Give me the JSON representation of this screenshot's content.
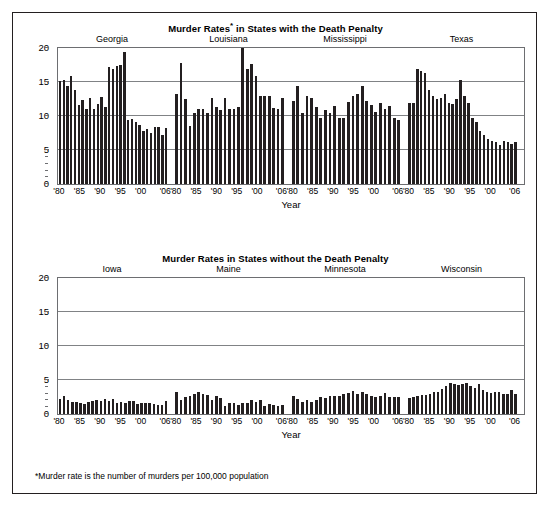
{
  "figure": {
    "footnote": "*Murder rate is the number of murders per 100,000 population",
    "frame_color": "#231f20",
    "bar_color": "#231f20",
    "grid_color": "#808285"
  },
  "chart_data": [
    {
      "type": "bar",
      "title": "Murder Rates* in States with the Death Penalty",
      "title_plain": "Murder Rates",
      "title_star": "*",
      "title_rest": " in States with the Death Penalty",
      "xlabel": "Year",
      "ylabel": "",
      "ylim": [
        0,
        20
      ],
      "yticks": [
        0,
        5,
        10,
        15,
        20
      ],
      "ytick_labels": [
        "0",
        "5",
        "10",
        "15",
        "20"
      ],
      "grid": true,
      "legend": "none",
      "x": [
        1980,
        1981,
        1982,
        1983,
        1984,
        1985,
        1986,
        1987,
        1988,
        1989,
        1990,
        1991,
        1992,
        1993,
        1994,
        1995,
        1996,
        1997,
        1998,
        1999,
        2000,
        2001,
        2002,
        2003,
        2004,
        2005,
        2006
      ],
      "xtick_years": [
        1980,
        1985,
        1990,
        1995,
        2000,
        2006
      ],
      "xtick_labels": [
        "'80",
        "'85",
        "'90",
        "'95",
        "'00",
        "'06"
      ],
      "series": [
        {
          "name": "Georgia",
          "values": [
            15.2,
            15.3,
            14.4,
            15.9,
            13.8,
            11.6,
            12.4,
            11.0,
            12.6,
            11.0,
            11.8,
            12.8,
            11.4,
            17.3,
            17.0,
            17.4,
            17.5,
            19.5,
            9.5,
            9.6,
            9.2,
            8.7,
            7.8,
            8.1,
            7.5,
            8.4,
            8.4,
            7.2,
            8.3
          ]
        },
        {
          "name": "Louisiana",
          "values": [
            13.3,
            17.8,
            12.5,
            8.6,
            10.4,
            11.0,
            11.1,
            10.5,
            12.7,
            11.3,
            10.9,
            12.6,
            11.1,
            11.0,
            11.4,
            20.0,
            16.9,
            17.7,
            15.9,
            13.0,
            13.0,
            12.9,
            11.2,
            11.1,
            12.7
          ]
        },
        {
          "name": "Mississippi",
          "values": [
            12.3,
            14.4,
            10.4,
            13.0,
            12.7,
            11.3,
            9.8,
            10.9,
            10.4,
            11.5,
            9.8,
            9.8,
            12.1,
            12.9,
            13.3,
            14.5,
            12.2,
            11.7,
            10.6,
            11.9,
            11.1,
            11.5,
            9.8,
            9.4
          ]
        },
        {
          "name": "Texas",
          "values": [
            12.0,
            11.9,
            16.9,
            16.7,
            16.3,
            13.8,
            12.9,
            12.5,
            12.7,
            13.3,
            12.0,
            11.8,
            12.5,
            15.3,
            13.0,
            11.9,
            9.8,
            9.1,
            7.8,
            7.2,
            6.6,
            6.3,
            6.2,
            5.8,
            6.4,
            6.2,
            5.9,
            6.2
          ]
        }
      ]
    },
    {
      "type": "bar",
      "title": "Murder Rates in States without the Death Penalty",
      "title_plain": "Murder Rates in States without the Death Penalty",
      "xlabel": "Year",
      "ylabel": "",
      "ylim": [
        0,
        20
      ],
      "yticks": [
        0,
        5,
        10,
        15,
        20
      ],
      "ytick_labels": [
        "0",
        "5",
        "10",
        "15",
        "20"
      ],
      "grid": true,
      "legend": "none",
      "x": [
        1980,
        1981,
        1982,
        1983,
        1984,
        1985,
        1986,
        1987,
        1988,
        1989,
        1990,
        1991,
        1992,
        1993,
        1994,
        1995,
        1996,
        1997,
        1998,
        1999,
        2000,
        2001,
        2002,
        2003,
        2004,
        2005,
        2006
      ],
      "xtick_years": [
        1980,
        1985,
        1990,
        1995,
        2000,
        2006
      ],
      "xtick_labels": [
        "'80",
        "'85",
        "'90",
        "'95",
        "'00",
        "'06"
      ],
      "series": [
        {
          "name": "Iowa",
          "values": [
            2.2,
            2.6,
            2.0,
            1.8,
            1.8,
            1.6,
            1.5,
            1.7,
            1.9,
            2.0,
            1.9,
            2.2,
            1.9,
            2.2,
            1.6,
            1.8,
            1.6,
            1.9,
            1.9,
            1.5,
            1.6,
            1.6,
            1.6,
            1.5,
            1.3,
            1.3,
            1.9
          ]
        },
        {
          "name": "Maine",
          "values": [
            3.3,
            2.1,
            2.5,
            2.6,
            2.9,
            3.3,
            3.0,
            2.8,
            2.1,
            2.6,
            2.4,
            1.2,
            1.6,
            1.6,
            1.3,
            1.6,
            1.6,
            2.0,
            1.7,
            2.0,
            1.2,
            1.4,
            1.3,
            1.2,
            1.3
          ]
        },
        {
          "name": "Minnesota",
          "values": [
            2.6,
            2.2,
            1.8,
            2.0,
            1.8,
            2.1,
            2.5,
            2.4,
            2.6,
            2.6,
            2.7,
            3.0,
            3.1,
            3.4,
            3.0,
            3.3,
            2.9,
            2.6,
            2.5,
            2.7,
            3.1,
            2.5,
            2.5,
            2.5
          ]
        },
        {
          "name": "Wisconsin",
          "values": [
            2.4,
            2.5,
            2.7,
            2.8,
            2.8,
            3.0,
            3.2,
            3.3,
            3.7,
            4.1,
            4.6,
            4.4,
            4.2,
            4.4,
            4.5,
            4.1,
            3.8,
            4.4,
            3.5,
            3.2,
            3.1,
            3.3,
            3.2,
            2.9,
            2.9,
            3.5,
            3.0
          ]
        }
      ]
    }
  ]
}
